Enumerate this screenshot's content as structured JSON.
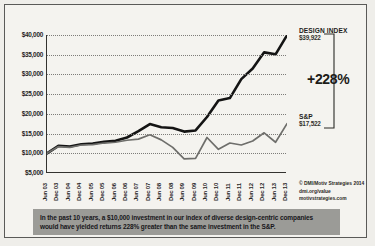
{
  "chart_data": {
    "type": "line",
    "title": "",
    "xlabel": "",
    "ylabel": "",
    "ylim": [
      5000,
      40000
    ],
    "ytick_values": [
      5000,
      10000,
      15000,
      20000,
      25000,
      30000,
      35000,
      40000
    ],
    "ytick_labels": [
      "$5,000",
      "$10,000",
      "$15,000",
      "$20,000",
      "$25,000",
      "$30,000",
      "$35,000",
      "$40,000"
    ],
    "grid": true,
    "legend_position": "right-annotations",
    "categories": [
      "Jun 03",
      "Dec 03",
      "Jun 04",
      "Dec 04",
      "Jun 05",
      "Dec 05",
      "Jun 06",
      "Dec 06",
      "Jun 07",
      "Dec 07",
      "Jun 08",
      "Dec 08",
      "Jun 09",
      "Dec 09",
      "Jun 10",
      "Dec 10",
      "Jun 11",
      "Dec 11",
      "Jun 12",
      "Dec 12",
      "Jun 13",
      "Dec 13"
    ],
    "series": [
      {
        "name": "Design Index",
        "color": "#141414",
        "values": [
          10000,
          11900,
          11700,
          12300,
          12500,
          12900,
          13200,
          14000,
          15600,
          17400,
          16600,
          16400,
          15500,
          15800,
          19200,
          23400,
          24000,
          28800,
          31500,
          35600,
          35100,
          39922
        ]
      },
      {
        "name": "S&P",
        "color": "#6e6e6b",
        "values": [
          10000,
          11700,
          11500,
          12100,
          12200,
          12600,
          12800,
          13300,
          13600,
          14700,
          13400,
          11500,
          8600,
          8700,
          14000,
          11000,
          12600,
          12100,
          13100,
          15200,
          12800,
          17522
        ]
      }
    ],
    "annotations": {
      "design_index_label": "DESIGN INDEX",
      "design_index_value": "$39,922",
      "sp_label": "S&P",
      "sp_value": "$17,522",
      "percent_gain": "+228%"
    }
  },
  "credits": {
    "line1": "© DMI/Motiv Strategies 2014",
    "line2": "dmi.org/value",
    "line3": "motivstrategies.com"
  },
  "caption": {
    "line1": "In the past 10 years, a $10,000 investment in our index of diverse design-centric companies",
    "line2": "would have yielded returns 228% greater than the same investment in the S&P."
  }
}
